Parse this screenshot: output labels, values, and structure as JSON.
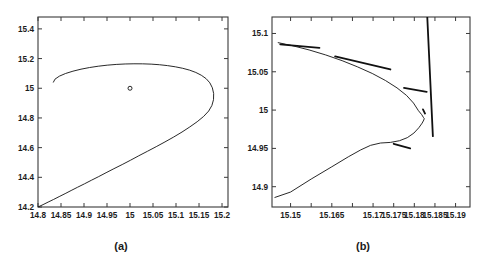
{
  "figure": {
    "background": "#ffffff",
    "line_color": "#111111",
    "axis_color": "#3a3a3a",
    "panel_count": 2
  },
  "panels": [
    {
      "caption": "(a)"
    },
    {
      "caption": "(b)"
    }
  ],
  "chart_data": [
    {
      "type": "line",
      "title": "",
      "subtitle": "",
      "panel_label": "(a)",
      "xlabel": "",
      "ylabel": "",
      "xlim": [
        14.8,
        15.213
      ],
      "ylim": [
        14.2,
        15.48
      ],
      "xticks": [
        14.8,
        14.85,
        14.9,
        14.95,
        15,
        15.05,
        15.1,
        15.15,
        15.2
      ],
      "yticks": [
        14.2,
        14.4,
        14.6,
        14.8,
        15,
        15.2,
        15.4
      ],
      "xticklabels": [
        "14.8",
        "14.85",
        "14.9",
        "14.95",
        "15",
        "15.05",
        "15.1",
        "15.15",
        "15.2"
      ],
      "yticklabels": [
        "14.2",
        "14.4",
        "14.6",
        "14.8",
        "15",
        "15.2",
        "15.4"
      ],
      "grid": false,
      "legend": null,
      "series": [
        {
          "name": "trajectory",
          "style": "solid",
          "x": [
            14.8,
            14.811,
            14.822,
            14.834,
            14.846,
            14.859,
            14.872,
            14.886,
            14.901,
            14.916,
            14.932,
            14.948,
            14.965,
            14.983,
            15.001,
            15.019,
            15.038,
            15.057,
            15.076,
            15.095,
            15.113,
            15.13,
            15.146,
            15.16,
            15.171,
            15.178,
            15.1815,
            15.1818,
            15.179,
            15.1735,
            15.1655,
            15.155,
            15.143,
            15.1295,
            15.1145,
            15.0985,
            15.0815,
            15.064,
            15.046,
            15.0275,
            15.0085,
            14.9895,
            14.97,
            14.9505,
            14.931,
            14.912,
            14.8935,
            14.876,
            14.86,
            14.8465,
            14.837,
            14.8335
          ],
          "y": [
            14.2,
            14.216,
            14.233,
            14.251,
            14.27,
            14.29,
            14.311,
            14.333,
            14.356,
            14.38,
            14.405,
            14.431,
            14.458,
            14.486,
            14.515,
            14.545,
            14.5755,
            14.6065,
            14.6385,
            14.6715,
            14.705,
            14.7395,
            14.7745,
            14.81,
            14.8465,
            14.884,
            14.923,
            14.964,
            15.003,
            15.0365,
            15.0645,
            15.0875,
            15.1065,
            15.122,
            15.1345,
            15.1445,
            15.1525,
            15.1585,
            15.1625,
            15.1645,
            15.1648,
            15.1635,
            15.1605,
            15.1555,
            15.1485,
            15.1395,
            15.1285,
            15.115,
            15.0995,
            15.0815,
            15.0615,
            15.041
          ]
        },
        {
          "name": "equilibrium-marker",
          "style": "circle-marker",
          "x": [
            15.0
          ],
          "y": [
            15.0
          ]
        }
      ]
    },
    {
      "type": "line",
      "title": "",
      "subtitle": "",
      "panel_label": "(b)",
      "xlabel": "",
      "ylabel": "",
      "xlim": [
        15.1455,
        15.1935
      ],
      "ylim": [
        14.8735,
        15.1215
      ],
      "xticks": [
        15.15,
        15.155,
        15.16,
        15.165,
        15.17,
        15.175,
        15.18,
        15.185,
        15.19
      ],
      "yticks": [
        14.9,
        14.95,
        15,
        15.05,
        15.1
      ],
      "xticklabels": [
        "15.15",
        "15.165",
        "15.17",
        "15.175",
        "15.18",
        "15.185",
        "15.19"
      ],
      "yticklabels": [
        "14.9",
        "14.95",
        "15",
        "15.05",
        "15.1"
      ],
      "grid": false,
      "legend": null,
      "series": [
        {
          "name": "trajectory-zoom",
          "style": "solid",
          "x": [
            15.147,
            15.1505,
            15.1545,
            15.1585,
            15.1625,
            15.1662,
            15.1698,
            15.173,
            15.1758,
            15.1781,
            15.1798,
            15.181,
            15.1818,
            15.1822,
            15.1824,
            15.1823,
            15.1819,
            15.1811,
            15.1799,
            15.1783,
            15.1764,
            15.1742,
            15.1718,
            15.1694,
            15.167,
            15.164,
            15.16,
            15.155,
            15.15,
            15.1462
          ],
          "y": [
            15.088,
            15.084,
            15.0785,
            15.072,
            15.0645,
            15.0565,
            15.0478,
            15.0386,
            15.029,
            15.0192,
            15.0092,
            14.9992,
            14.994,
            14.9905,
            14.989,
            14.987,
            14.983,
            14.977,
            14.97,
            14.964,
            14.96,
            14.9578,
            14.957,
            14.954,
            14.948,
            14.939,
            14.926,
            14.91,
            14.893,
            14.886
          ]
        },
        {
          "name": "overlay-segment-1",
          "style": "thick",
          "x": [
            15.1475,
            15.157
          ],
          "y": [
            15.0858,
            15.0812
          ]
        },
        {
          "name": "overlay-segment-2",
          "style": "thick",
          "x": [
            15.1608,
            15.1742
          ],
          "y": [
            15.07,
            15.053
          ]
        },
        {
          "name": "overlay-segment-3",
          "style": "thick",
          "x": [
            15.1775,
            15.183
          ],
          "y": [
            15.029,
            15.0238
          ]
        },
        {
          "name": "overlay-segment-4",
          "style": "thick",
          "x": [
            15.1821,
            15.1826
          ],
          "y": [
            15.001,
            14.9955
          ]
        },
        {
          "name": "overlay-segment-5",
          "style": "thick",
          "x": [
            15.1758,
            15.1845
          ],
          "y": [
            15.963,
            14.966
          ]
        },
        {
          "name": "overlay-segment-6",
          "style": "thick",
          "x": [
            15.175,
            15.179
          ],
          "y": [
            14.956,
            14.95
          ]
        }
      ]
    }
  ]
}
